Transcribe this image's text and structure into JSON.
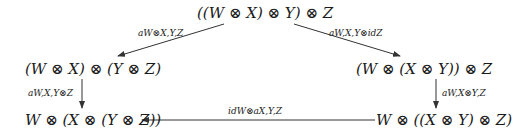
{
  "diagram": {
    "nodes": {
      "top": "((W ⊗ X) ⊗ Y) ⊗ Z",
      "left": "(W ⊗ X) ⊗ (Y ⊗ Z)",
      "right": "(W ⊗ (X ⊗ Y)) ⊗ Z",
      "bottom_left": "W ⊗ (X ⊗ (Y ⊗ Z))",
      "bottom_right": "W ⊗ ((X ⊗ Y) ⊗ Z)"
    },
    "arrows": {
      "top_to_left": "a_{W⊗X,Y,Z}",
      "top_to_right": "a_{W,X,Y} ⊗ id_Z",
      "left_to_bottom_left": "a_{W,X,Y⊗Z}",
      "right_to_bottom_right": "a_{W,X⊗Y,Z}",
      "bottom_right_to_bottom_left": "id_W ⊗ a_{X,Y,Z}"
    },
    "arrow_labels_display": {
      "top_to_left": "aW⊗X,Y,Z",
      "top_to_right": "aW,X,Y⊗idZ",
      "left_to_bottom_left": "aW,X,Y⊗Z",
      "right_to_bottom_right": "aW,X⊗Y,Z",
      "bottom_right_to_bottom_left": "idW⊗aX,Y,Z"
    },
    "colors": {
      "stroke": "#333333",
      "text": "#1a1a1a"
    }
  }
}
